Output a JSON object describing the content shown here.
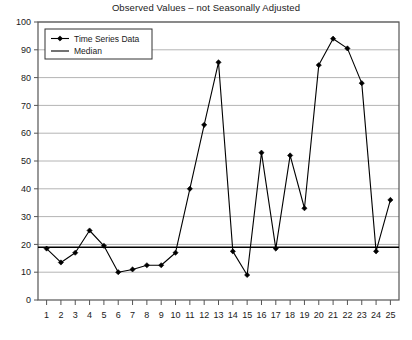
{
  "chart_data": {
    "type": "line",
    "title": "Observed Values – not Seasonally Adjusted",
    "xlabel": "",
    "ylabel": "",
    "xlim": [
      0.4,
      25.6
    ],
    "ylim": [
      0,
      100
    ],
    "ytick_step": 10,
    "yticks": [
      0,
      10,
      20,
      30,
      40,
      50,
      60,
      70,
      80,
      90,
      100
    ],
    "xticks": [
      1,
      2,
      3,
      4,
      5,
      6,
      7,
      8,
      9,
      10,
      11,
      12,
      13,
      14,
      15,
      16,
      17,
      18,
      19,
      20,
      21,
      22,
      23,
      24,
      25
    ],
    "x": [
      1,
      2,
      3,
      4,
      5,
      6,
      7,
      8,
      9,
      10,
      11,
      12,
      13,
      14,
      15,
      16,
      17,
      18,
      19,
      20,
      21,
      22,
      23,
      24,
      25
    ],
    "grid": true,
    "legend_position": "top-left",
    "series": [
      {
        "name": "Time Series Data",
        "marker": "diamond",
        "color": "#000000",
        "values": [
          18.5,
          13.5,
          17,
          25,
          19.5,
          10,
          11,
          12.5,
          12.5,
          17,
          40,
          63,
          85.5,
          17.5,
          9,
          53,
          18.5,
          52,
          33,
          84.5,
          94,
          90.5,
          78,
          17.5,
          36
        ]
      },
      {
        "name": "Median",
        "marker": "none",
        "color": "#000000",
        "value": 19,
        "type": "horizontal-line"
      }
    ]
  },
  "legend": {
    "items": [
      {
        "label": "Time Series Data",
        "marker": "line-diamond"
      },
      {
        "label": "Median",
        "marker": "line"
      }
    ]
  },
  "colors": {
    "series_line": "#000000",
    "median_line": "#000000",
    "gridline": "#b4b4b4",
    "axis": "#555555",
    "plot_border": "#555555",
    "background": "#ffffff",
    "text": "#1a1a1a"
  }
}
